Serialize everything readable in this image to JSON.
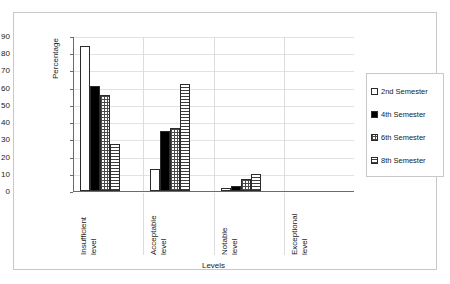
{
  "chart_data": {
    "type": "bar",
    "title": "",
    "xlabel": "Levels",
    "ylabel": "Percentage",
    "ylim": [
      0,
      90
    ],
    "yticks": [
      "90",
      "80",
      "70",
      "60",
      "50",
      "40",
      "30",
      "20",
      "10",
      "0"
    ],
    "grid": true,
    "legend_position": "right",
    "categories": [
      "Insufficient level",
      "Acceptable level",
      "Notable level",
      "Exceptional level"
    ],
    "category_lines": [
      [
        "Insufficient",
        "level"
      ],
      [
        "Acceptable",
        "level"
      ],
      [
        "Notable",
        "level"
      ],
      [
        "Exceptional",
        "level"
      ]
    ],
    "series": [
      {
        "name": "2nd Semester",
        "pattern": "empty",
        "values": [
          84,
          12.8,
          2,
          0
        ]
      },
      {
        "name": "4th Semester",
        "pattern": "solid",
        "values": [
          61,
          35,
          3,
          0
        ]
      },
      {
        "name": "6th Semester",
        "pattern": "grid",
        "values": [
          55.5,
          36.3,
          7,
          0
        ]
      },
      {
        "name": "8th Semester",
        "pattern": "hlines",
        "values": [
          27.5,
          62,
          10,
          0
        ]
      }
    ]
  },
  "legend": {
    "items": [
      {
        "label": "2nd Semester"
      },
      {
        "label": "4th Semester"
      },
      {
        "label": "6th Semester"
      },
      {
        "label": "8th Semester"
      }
    ]
  },
  "colors": {
    "frame": "#c8c8c8",
    "axis": "#6b6b6b",
    "gridline": "#e2e2e2",
    "bar_outline": "#2b2b2b",
    "text": "#1a1a1a",
    "series_solid": "#000000",
    "series_empty": "#ffffff"
  }
}
